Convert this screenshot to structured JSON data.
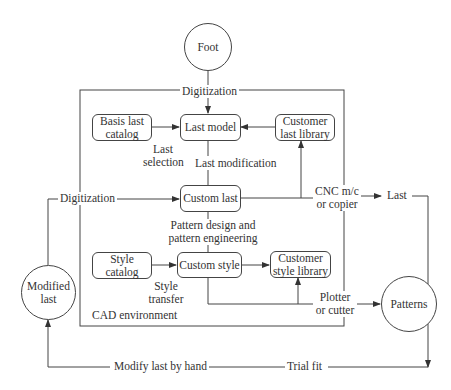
{
  "nodes": {
    "foot": "Foot",
    "basis_last_catalog": "Basis last\ncatalog",
    "last_model": "Last model",
    "customer_last_library": "Customer\nlast library",
    "custom_last": "Custom last",
    "style_catalog": "Style catalog",
    "custom_style": "Custom style",
    "customer_style_library": "Customer\nstyle library",
    "modified_last": "Modified\nlast",
    "patterns": "Patterns"
  },
  "edge_labels": {
    "digitization_top": "Digitization",
    "last_selection": "Last\nselection",
    "last_modification": "Last modification",
    "digitization_left": "Digitization",
    "cnc": "CNC m/c\nor copier",
    "last_out": "Last",
    "pattern_design": "Pattern design and\npattern engineering",
    "style_transfer": "Style\ntransfer",
    "plotter": "Plotter\nor cutter",
    "modify_by_hand": "Modify last by hand",
    "trial_fit": "Trial fit"
  },
  "container": {
    "label": "CAD environment"
  }
}
